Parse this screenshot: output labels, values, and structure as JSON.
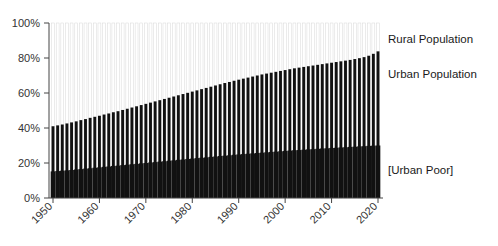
{
  "chart_data": {
    "type": "bar",
    "title": "",
    "subtitle": "",
    "xlabel": "",
    "ylabel": "",
    "stacked": true,
    "grid": false,
    "legend_position": "right",
    "xlim": [
      1950,
      2020
    ],
    "ylim": [
      0,
      100
    ],
    "ytick_labels": [
      "0%",
      "20%",
      "40%",
      "60%",
      "80%",
      "100%"
    ],
    "ytick_values": [
      0,
      20,
      40,
      60,
      80,
      100
    ],
    "xtick_labels": [
      "1950",
      "1960",
      "1970",
      "1980",
      "1990",
      "2000",
      "2010",
      "2020"
    ],
    "xtick_values": [
      1950,
      1960,
      1970,
      1980,
      1990,
      2000,
      2010,
      2020
    ],
    "categories": [
      1950,
      1951,
      1952,
      1953,
      1954,
      1955,
      1956,
      1957,
      1958,
      1959,
      1960,
      1961,
      1962,
      1963,
      1964,
      1965,
      1966,
      1967,
      1968,
      1969,
      1970,
      1971,
      1972,
      1973,
      1974,
      1975,
      1976,
      1977,
      1978,
      1979,
      1980,
      1981,
      1982,
      1983,
      1984,
      1985,
      1986,
      1987,
      1988,
      1989,
      1990,
      1991,
      1992,
      1993,
      1994,
      1995,
      1996,
      1997,
      1998,
      1999,
      2000,
      2001,
      2002,
      2003,
      2004,
      2005,
      2006,
      2007,
      2008,
      2009,
      2010,
      2011,
      2012,
      2013,
      2014,
      2015,
      2016,
      2017,
      2018,
      2019,
      2020
    ],
    "series": [
      {
        "name": "[Urban Poor]",
        "color": "#111111",
        "values": [
          15.2,
          15.4,
          15.6,
          15.8,
          16.0,
          16.3,
          16.5,
          16.8,
          17.0,
          17.3,
          17.5,
          17.8,
          18.0,
          18.3,
          18.5,
          18.8,
          19.0,
          19.3,
          19.5,
          19.8,
          20.0,
          20.3,
          20.5,
          20.8,
          21.0,
          21.3,
          21.5,
          21.8,
          22.0,
          22.3,
          22.5,
          22.8,
          23.0,
          23.2,
          23.5,
          23.7,
          24.0,
          24.2,
          24.4,
          24.7,
          24.9,
          25.1,
          25.3,
          25.5,
          25.7,
          25.9,
          26.1,
          26.3,
          26.5,
          26.7,
          26.9,
          27.1,
          27.3,
          27.4,
          27.6,
          27.8,
          27.9,
          28.1,
          28.3,
          28.4,
          28.6,
          28.7,
          28.9,
          29.0,
          29.2,
          29.3,
          29.5,
          29.6,
          29.8,
          29.9,
          30.0
        ]
      },
      {
        "name": "Urban Population",
        "color": "#111111",
        "values": [
          41.0,
          41.5,
          42.0,
          42.6,
          43.2,
          43.8,
          44.5,
          45.1,
          45.8,
          46.4,
          47.0,
          47.7,
          48.3,
          49.0,
          49.6,
          50.3,
          51.0,
          51.7,
          52.4,
          53.1,
          53.8,
          54.5,
          55.2,
          55.9,
          56.6,
          57.3,
          58.0,
          58.7,
          59.4,
          60.1,
          60.8,
          61.5,
          62.2,
          62.9,
          63.6,
          64.3,
          65.0,
          65.7,
          66.3,
          67.0,
          67.6,
          68.2,
          68.8,
          69.4,
          70.0,
          70.6,
          71.1,
          71.6,
          72.1,
          72.6,
          73.1,
          73.6,
          74.1,
          74.5,
          74.9,
          75.3,
          75.7,
          76.1,
          76.5,
          76.9,
          77.3,
          77.7,
          78.1,
          78.5,
          78.9,
          79.4,
          79.9,
          80.5,
          81.3,
          82.4,
          83.8
        ]
      },
      {
        "name": "Rural Population",
        "color": "#ffffff",
        "values": [
          100,
          100,
          100,
          100,
          100,
          100,
          100,
          100,
          100,
          100,
          100,
          100,
          100,
          100,
          100,
          100,
          100,
          100,
          100,
          100,
          100,
          100,
          100,
          100,
          100,
          100,
          100,
          100,
          100,
          100,
          100,
          100,
          100,
          100,
          100,
          100,
          100,
          100,
          100,
          100,
          100,
          100,
          100,
          100,
          100,
          100,
          100,
          100,
          100,
          100,
          100,
          100,
          100,
          100,
          100,
          100,
          100,
          100,
          100,
          100,
          100,
          100,
          100,
          100,
          100,
          100,
          100,
          100,
          100,
          100,
          100
        ]
      }
    ],
    "annotations": [
      {
        "id": "rural-population",
        "text": "Rural Population",
        "x": 2022,
        "y": 91
      },
      {
        "id": "urban-population",
        "text": "Urban Population",
        "x": 2022,
        "y": 71
      },
      {
        "id": "urban-poor",
        "text": "[Urban Poor]",
        "x": 2022,
        "y": 16
      }
    ]
  }
}
